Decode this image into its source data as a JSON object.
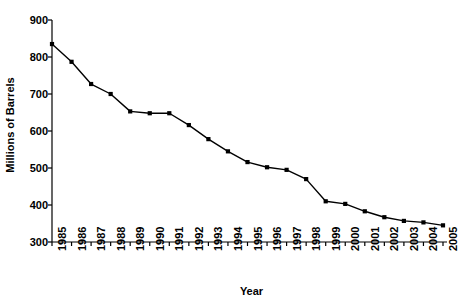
{
  "chart_data": {
    "type": "line",
    "title": "",
    "xlabel": "Year",
    "ylabel": "Millions of Barrels",
    "categories": [
      "1985",
      "1986",
      "1987",
      "1988",
      "1989",
      "1990",
      "1991",
      "1992",
      "1993",
      "1994",
      "1995",
      "1996",
      "1997",
      "1998",
      "1999",
      "2000",
      "2001",
      "2002",
      "2003",
      "2004",
      "2005"
    ],
    "x": [
      1985,
      1986,
      1987,
      1988,
      1989,
      1990,
      1991,
      1992,
      1993,
      1994,
      1995,
      1996,
      1997,
      1998,
      1999,
      2000,
      2001,
      2002,
      2003,
      2004,
      2005
    ],
    "values": [
      835,
      787,
      727,
      700,
      653,
      648,
      648,
      616,
      578,
      545,
      516,
      502,
      495,
      470,
      410,
      403,
      383,
      367,
      357,
      353,
      345
    ],
    "series": [
      {
        "name": "Millions of Barrels",
        "values": [
          835,
          787,
          727,
          700,
          653,
          648,
          648,
          616,
          578,
          545,
          516,
          502,
          495,
          470,
          410,
          403,
          383,
          367,
          357,
          353,
          345
        ]
      }
    ],
    "ylim": [
      300,
      900
    ],
    "yticks": [
      300,
      400,
      500,
      600,
      700,
      800,
      900
    ],
    "ytick_labels": [
      "300",
      "400",
      "500",
      "600",
      "700",
      "800",
      "900"
    ],
    "xlim": [
      1985,
      2005
    ],
    "grid": false,
    "legend": false,
    "legend_position": "none",
    "marker": "square",
    "line_color": "#000000",
    "marker_color": "#000000",
    "background_color": "#ffffff",
    "axis_color": "#000000"
  }
}
